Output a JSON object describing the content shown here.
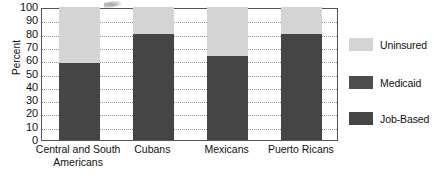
{
  "chart_data": {
    "type": "bar",
    "subtype": "stacked-bar",
    "title": "",
    "xlabel": "",
    "ylabel": "Percent",
    "ylim": [
      0,
      100
    ],
    "ytick_step": 10,
    "yticks": [
      100,
      90,
      80,
      70,
      60,
      50,
      40,
      30,
      20,
      10,
      0
    ],
    "grid": true,
    "grid_style": "dotted-horizontal",
    "legend_position": "right",
    "categories": [
      "Central and South Americans",
      "Cubans",
      "Mexicans",
      "Puerto Ricans"
    ],
    "category_label_lines": [
      [
        "Central and South",
        "Americans"
      ],
      [
        "Cubans"
      ],
      [
        "Mexicans"
      ],
      [
        "Puerto Ricans"
      ]
    ],
    "series": [
      {
        "name": "Job-Based",
        "color": "#454545",
        "values": [
          58,
          80,
          63,
          80
        ]
      },
      {
        "name": "Medicaid",
        "color": "#4d4d4d",
        "values": [
          0,
          0,
          0,
          0
        ]
      },
      {
        "name": "Uninsured",
        "color": "#d4d4d4",
        "values": [
          42,
          20,
          37,
          20
        ]
      }
    ],
    "stack_order_bottom_to_top": [
      "Job-Based",
      "Medicaid",
      "Uninsured"
    ],
    "bar_tops": [
      100,
      100,
      100,
      100
    ]
  },
  "legend": {
    "items": [
      {
        "label": "Uninsured",
        "color": "#d4d4d4"
      },
      {
        "label": "Medicaid",
        "color": "#4d4d4d"
      },
      {
        "label": "Job-Based",
        "color": "#454545"
      }
    ]
  },
  "axis": {
    "y_title": "Percent"
  }
}
